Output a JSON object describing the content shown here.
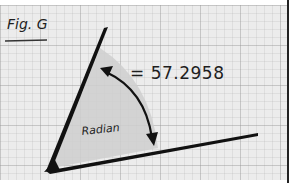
{
  "figure": {
    "label": "Fig. G",
    "angle_label": "Radian",
    "equation": "= 57.2958",
    "colors": {
      "paper": "#ececec",
      "grid": "#b4b4b4",
      "ink": "#111111",
      "sector_fill": "#cfcfcf"
    }
  }
}
